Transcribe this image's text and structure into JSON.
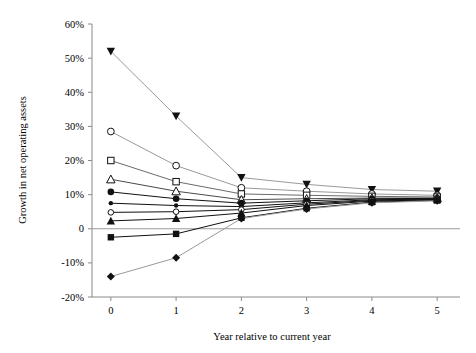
{
  "chart_data": {
    "type": "line",
    "title": "",
    "xlabel": "Year relative to current year",
    "ylabel": "Growth in net operating assets",
    "x": [
      0,
      1,
      2,
      3,
      4,
      5
    ],
    "xticklabels": [
      "0",
      "1",
      "2",
      "3",
      "4",
      "5"
    ],
    "xlim": [
      -0.35,
      5.35
    ],
    "ylim": [
      -20,
      60
    ],
    "yticks": [
      -20,
      -10,
      0,
      10,
      20,
      30,
      40,
      50,
      60
    ],
    "yticklabels": [
      "-20%",
      "-10%",
      "0",
      "10%",
      "20%",
      "30%",
      "40%",
      "50%",
      "60%"
    ],
    "grid": false,
    "legend": "none",
    "zero_line": true,
    "series": [
      {
        "name": "Decile 10 (highest)",
        "marker": "filled-inverted-triangle",
        "color": "#9a9a9a",
        "values": [
          52.0,
          33.0,
          15.0,
          13.0,
          11.5,
          11.0
        ]
      },
      {
        "name": "Decile 9",
        "marker": "open-circle",
        "color": "#9a9a9a",
        "values": [
          28.5,
          18.5,
          12.0,
          11.0,
          10.2,
          9.8
        ]
      },
      {
        "name": "Decile 8",
        "marker": "open-square",
        "color": "#6b6b6b",
        "values": [
          20.0,
          13.8,
          10.2,
          9.8,
          9.5,
          9.3
        ]
      },
      {
        "name": "Decile 7",
        "marker": "open-triangle",
        "color": "#4a4a4a",
        "values": [
          14.5,
          11.0,
          8.5,
          8.8,
          9.0,
          9.0
        ]
      },
      {
        "name": "Decile 6",
        "marker": "filled-circle",
        "color": "#111111",
        "values": [
          10.8,
          8.8,
          7.5,
          8.2,
          8.8,
          8.9
        ]
      },
      {
        "name": "Decile 5",
        "marker": "small-filled-circle",
        "color": "#111111",
        "values": [
          7.5,
          6.8,
          6.5,
          7.6,
          8.5,
          8.7
        ]
      },
      {
        "name": "Decile 4",
        "marker": "open-circle-small",
        "color": "#111111",
        "values": [
          4.8,
          5.0,
          5.6,
          7.2,
          8.3,
          8.6
        ]
      },
      {
        "name": "Decile 3",
        "marker": "filled-triangle",
        "color": "#111111",
        "values": [
          2.3,
          3.0,
          4.6,
          6.8,
          8.1,
          8.5
        ]
      },
      {
        "name": "Decile 2",
        "marker": "filled-square",
        "color": "#111111",
        "values": [
          -2.5,
          -1.5,
          3.2,
          6.0,
          7.8,
          8.3
        ]
      },
      {
        "name": "Decile 1 (lowest)",
        "marker": "filled-diamond",
        "color": "#9a9a9a",
        "values": [
          -14.0,
          -8.5,
          3.0,
          5.8,
          7.6,
          8.2
        ]
      }
    ]
  }
}
